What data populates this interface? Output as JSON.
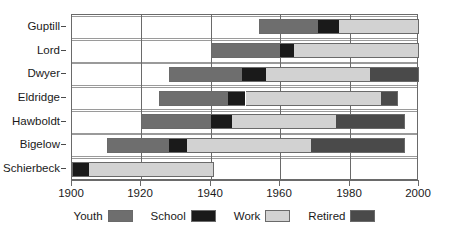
{
  "chart_data": {
    "type": "bar",
    "subtype": "stacked-horizontal-timeline",
    "title": "",
    "xlabel": "",
    "ylabel": "",
    "xlim": [
      1900,
      2000
    ],
    "xticks": [
      1900,
      1920,
      1940,
      1960,
      1980,
      2000
    ],
    "xticklabels": [
      "1900",
      "1920",
      "1940",
      "1960",
      "1980",
      "2000"
    ],
    "grid": true,
    "grid_axis": "x",
    "legend_position": "bottom",
    "categories": [
      "Guptill",
      "Lord",
      "Dwyer",
      "Eldridge",
      "Hawboldt",
      "Bigelow",
      "Schierbeck"
    ],
    "series": [
      {
        "name": "Youth",
        "color": "#6e6e6e"
      },
      {
        "name": "School",
        "color": "#1a1a1a"
      },
      {
        "name": "Work",
        "color": "#d2d2d2"
      },
      {
        "name": "Retired",
        "color": "#4a4a4a"
      }
    ],
    "rows": [
      {
        "label": "Guptill",
        "segments": [
          {
            "phase": "Youth",
            "start": 1954,
            "end": 1971
          },
          {
            "phase": "School",
            "start": 1971,
            "end": 1977
          },
          {
            "phase": "Work",
            "start": 1977,
            "end": 2000
          }
        ]
      },
      {
        "label": "Lord",
        "segments": [
          {
            "phase": "Youth",
            "start": 1940,
            "end": 1960
          },
          {
            "phase": "School",
            "start": 1960,
            "end": 1964
          },
          {
            "phase": "Work",
            "start": 1964,
            "end": 2000
          }
        ]
      },
      {
        "label": "Dwyer",
        "segments": [
          {
            "phase": "Youth",
            "start": 1928,
            "end": 1949
          },
          {
            "phase": "School",
            "start": 1949,
            "end": 1956
          },
          {
            "phase": "Work",
            "start": 1956,
            "end": 1986
          },
          {
            "phase": "Retired",
            "start": 1986,
            "end": 2000
          }
        ]
      },
      {
        "label": "Eldridge",
        "segments": [
          {
            "phase": "Youth",
            "start": 1925,
            "end": 1945
          },
          {
            "phase": "School",
            "start": 1945,
            "end": 1950
          },
          {
            "phase": "Work",
            "start": 1950,
            "end": 1989
          },
          {
            "phase": "Retired",
            "start": 1989,
            "end": 1994
          }
        ]
      },
      {
        "label": "Hawboldt",
        "segments": [
          {
            "phase": "Youth",
            "start": 1920,
            "end": 1940
          },
          {
            "phase": "School",
            "start": 1940,
            "end": 1946
          },
          {
            "phase": "Work",
            "start": 1946,
            "end": 1976
          },
          {
            "phase": "Retired",
            "start": 1976,
            "end": 1996
          }
        ]
      },
      {
        "label": "Bigelow",
        "segments": [
          {
            "phase": "Youth",
            "start": 1910,
            "end": 1928
          },
          {
            "phase": "School",
            "start": 1928,
            "end": 1933
          },
          {
            "phase": "Work",
            "start": 1933,
            "end": 1969
          },
          {
            "phase": "Retired",
            "start": 1969,
            "end": 1996
          }
        ]
      },
      {
        "label": "Schierbeck",
        "segments": [
          {
            "phase": "School",
            "start": 1900,
            "end": 1905
          },
          {
            "phase": "Work",
            "start": 1905,
            "end": 1941
          }
        ]
      }
    ],
    "legend": [
      {
        "label": "Youth",
        "color": "#6e6e6e"
      },
      {
        "label": "School",
        "color": "#1a1a1a"
      },
      {
        "label": "Work",
        "color": "#d2d2d2"
      },
      {
        "label": "Retired",
        "color": "#4a4a4a"
      }
    ]
  }
}
